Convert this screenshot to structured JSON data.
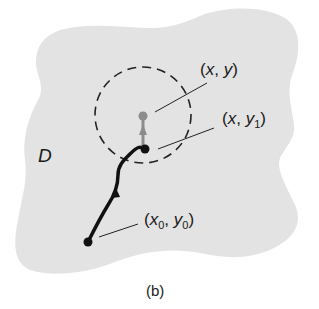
{
  "figure": {
    "region_label": "D",
    "caption": "(b)",
    "points": {
      "xy": {
        "open": "(",
        "x": "x",
        "sep": ", ",
        "y": "y",
        "close": ")"
      },
      "xy1": {
        "open": "(",
        "x": "x",
        "sep": ", ",
        "y": "y",
        "ysub": "1",
        "close": ")"
      },
      "x0y0": {
        "open": "(",
        "x": "x",
        "xsub": "0",
        "sep": ", ",
        "y": "y",
        "ysub": "0",
        "close": ")"
      }
    },
    "colors": {
      "region_fill": "#e3e3e3",
      "path": "#111111",
      "gray_segment": "#8c8c8c",
      "dashed_circle": "#222222"
    }
  }
}
